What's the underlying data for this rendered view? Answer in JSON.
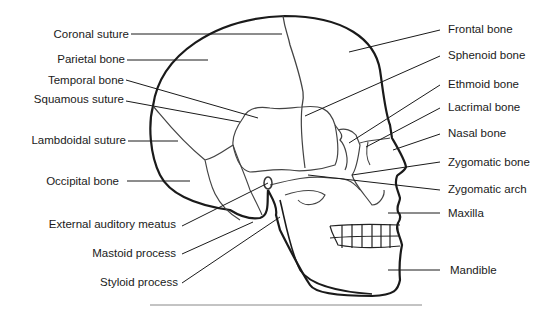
{
  "diagram": {
    "left_labels": [
      {
        "id": "coronal-suture",
        "text": "Coronal suture"
      },
      {
        "id": "parietal-bone",
        "text": "Parietal bone"
      },
      {
        "id": "temporal-bone",
        "text": "Temporal bone"
      },
      {
        "id": "squamous-suture",
        "text": "Squamous suture"
      },
      {
        "id": "lambdoidal-suture",
        "text": "Lambdoidal suture"
      },
      {
        "id": "occipital-bone",
        "text": "Occipital bone"
      },
      {
        "id": "external-auditory-meatus",
        "text": "External auditory meatus"
      },
      {
        "id": "mastoid-process",
        "text": "Mastoid process"
      },
      {
        "id": "styloid-process",
        "text": "Styloid process"
      }
    ],
    "right_labels": [
      {
        "id": "frontal-bone",
        "text": "Frontal bone"
      },
      {
        "id": "sphenoid-bone",
        "text": "Sphenoid bone"
      },
      {
        "id": "ethmoid-bone",
        "text": "Ethmoid bone"
      },
      {
        "id": "lacrimal-bone",
        "text": "Lacrimal bone"
      },
      {
        "id": "nasal-bone",
        "text": "Nasal bone"
      },
      {
        "id": "zygomatic-bone",
        "text": "Zygomatic bone"
      },
      {
        "id": "zygomatic-arch",
        "text": "Zygomatic arch"
      },
      {
        "id": "maxilla",
        "text": "Maxilla"
      },
      {
        "id": "mandible",
        "text": "Mandible"
      }
    ],
    "colors": {
      "outline": "#1a1a1a",
      "suture": "#444444",
      "leader": "#1a1a1a",
      "background": "#ffffff"
    }
  }
}
